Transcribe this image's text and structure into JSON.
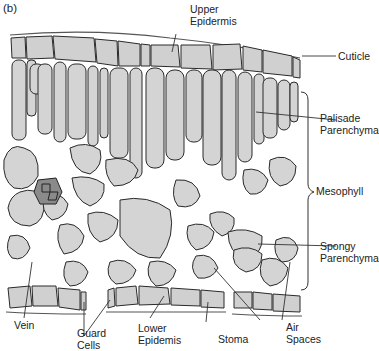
{
  "figure": {
    "panel_label": "(b)"
  },
  "labels": {
    "upper_epidermis": [
      "Upper",
      "Epidermis"
    ],
    "cuticle": [
      "Cuticle"
    ],
    "palisade_parenchyma": [
      "Palisade",
      "Parenchyma"
    ],
    "mesophyll": [
      "Mesophyll"
    ],
    "spongy_parenchyma": [
      "Spongy",
      "Parenchyma"
    ],
    "vein": [
      "Vein"
    ],
    "guard_cells": [
      "Guard",
      "Cells"
    ],
    "lower_epidermis": [
      "Lower",
      "Epidemis"
    ],
    "stoma": [
      "Stoma"
    ],
    "air_spaces": [
      "Air",
      "Spaces"
    ]
  },
  "colors": {
    "cell_fill": "#d4d4d4",
    "cell_outline": "#2a2a2a",
    "vein_fill": "#8a8a8a",
    "background": "#ffffff"
  }
}
